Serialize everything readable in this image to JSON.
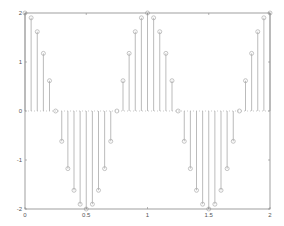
{
  "chart_data": {
    "type": "stem",
    "title": "",
    "xlabel": "",
    "ylabel": "",
    "xlim": [
      0,
      2
    ],
    "ylim": [
      -2,
      2
    ],
    "xticks": [
      0,
      0.5,
      1,
      1.5,
      2
    ],
    "xtick_labels": [
      "0",
      "0.5",
      "1",
      "1.5",
      "2"
    ],
    "yticks": [
      -2,
      -1,
      0,
      1,
      2
    ],
    "ytick_labels": [
      "-2",
      "-1",
      "0",
      "1",
      "2"
    ],
    "grid": false,
    "marker": "circle",
    "x": [
      0,
      0.05,
      0.1,
      0.15,
      0.2,
      0.25,
      0.3,
      0.35,
      0.4,
      0.45,
      0.5,
      0.55,
      0.6,
      0.65,
      0.7,
      0.75,
      0.8,
      0.85,
      0.9,
      0.95,
      1,
      1.05,
      1.1,
      1.15,
      1.2,
      1.25,
      1.3,
      1.35,
      1.4,
      1.45,
      1.5,
      1.55,
      1.6,
      1.65,
      1.7,
      1.75,
      1.8,
      1.85,
      1.9,
      1.95,
      2
    ],
    "values": [
      2,
      1.902,
      1.618,
      1.176,
      0.618,
      0,
      -0.618,
      -1.176,
      -1.618,
      -1.902,
      -2,
      -1.902,
      -1.618,
      -1.176,
      -0.618,
      0,
      0.618,
      1.176,
      1.618,
      1.902,
      2,
      1.902,
      1.618,
      1.176,
      0.618,
      0,
      -0.618,
      -1.176,
      -1.618,
      -1.902,
      -2,
      -1.902,
      -1.618,
      -1.176,
      -0.618,
      0,
      0.618,
      1.176,
      1.618,
      1.902,
      2
    ]
  },
  "colors": {
    "axis": "#888888",
    "stem": "#aaaaaa",
    "baseline": "#aaaaaa"
  }
}
